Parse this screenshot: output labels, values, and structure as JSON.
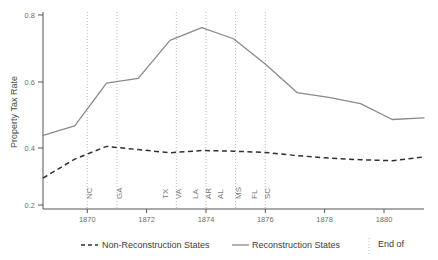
{
  "chart_data": {
    "type": "line",
    "title": "",
    "xlabel": "",
    "ylabel": "Property Tax Rate",
    "xlim": [
      1869,
      1881
    ],
    "ylim": [
      0.2,
      0.82
    ],
    "grid": false,
    "legend_position": "bottom",
    "x": [
      1869,
      1870,
      1871,
      1872,
      1873,
      1874,
      1875,
      1876,
      1877,
      1878,
      1879,
      1880,
      1881
    ],
    "series": [
      {
        "name": "Reconstruction States",
        "style": "solid",
        "color": "#8a8a8a",
        "values": [
          0.42,
          0.45,
          0.585,
          0.6,
          0.72,
          0.76,
          0.725,
          0.645,
          0.555,
          0.54,
          0.52,
          0.47,
          0.475
        ]
      },
      {
        "name": "Non-Reconstruction States",
        "style": "dashed",
        "color": "#2f2f2f",
        "values": [
          0.285,
          0.345,
          0.385,
          0.375,
          0.365,
          0.372,
          0.37,
          0.366,
          0.356,
          0.348,
          0.343,
          0.34,
          0.352
        ]
      }
    ],
    "ytick_labels": [
      "0.8",
      "0.6",
      "0.4",
      "0.2"
    ],
    "ytick_values": [
      0.8,
      0.6,
      0.4,
      0.2
    ],
    "xtick_labels": [
      "1870",
      "1872",
      "1874",
      "1876",
      "1878",
      "1880"
    ],
    "xtick_values": [
      1870,
      1872,
      1874,
      1876,
      1878,
      1880
    ],
    "event_lines": [
      {
        "year": 1870,
        "label": "NC"
      },
      {
        "year": 1871,
        "label": "GA"
      },
      {
        "year": 1873,
        "label": "TX"
      },
      {
        "year": 1873.45,
        "label": "VA"
      },
      {
        "year": 1874,
        "label": "LA"
      },
      {
        "year": 1874.4,
        "label": "AR"
      },
      {
        "year": 1874.8,
        "label": "AL"
      },
      {
        "year": 1875,
        "label": "MS"
      },
      {
        "year": 1876,
        "label": "FL"
      },
      {
        "year": 1876.45,
        "label": "SC"
      }
    ],
    "event_line_years": [
      1870,
      1871,
      1873,
      1874,
      1875,
      1876
    ]
  },
  "legend": {
    "items": [
      {
        "label": "Non-Reconstruction States",
        "style": "dashed"
      },
      {
        "label": "Reconstruction States",
        "style": "solid"
      },
      {
        "label": "End of",
        "style": "vline"
      }
    ]
  }
}
